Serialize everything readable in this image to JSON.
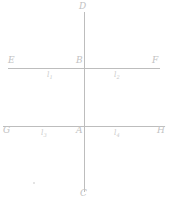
{
  "figure": {
    "background_color": "#ffffff",
    "line_color": "#bdbdbd",
    "label_color": "#c2c2c2",
    "segment_label_color": "#cbcbcb",
    "points": {
      "top": "D",
      "bottom": "C",
      "upper_left": "E",
      "upper_right": "F",
      "upper_intersection": "B",
      "lower_left": "G",
      "lower_right": "H",
      "lower_intersection": "A"
    },
    "segments": {
      "upper_left": "l",
      "upper_left_sub": "1",
      "upper_right": "l",
      "upper_right_sub": "2",
      "lower_left": "l",
      "lower_left_sub": "3",
      "lower_right": "l",
      "lower_right_sub": "4"
    },
    "geometry": {
      "vertical_line": {
        "x": 84.5,
        "y1": 12,
        "y2": 192
      },
      "upper_horizontal_line": {
        "y": 68.5,
        "x1": 8,
        "x2": 160
      },
      "lower_horizontal_line": {
        "y": 126.5,
        "x1": 3,
        "x2": 165
      }
    }
  }
}
